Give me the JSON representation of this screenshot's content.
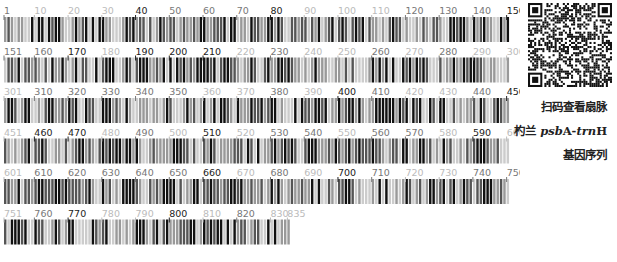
{
  "figure": {
    "type": "dna-barcode",
    "sequence_length": 835,
    "positions_per_row": 150,
    "rows": [
      {
        "start": 1,
        "end": 150,
        "labels": [
          "1",
          "10",
          "20",
          "30",
          "40",
          "50",
          "60",
          "70",
          "80",
          "90",
          "100",
          "110",
          "120",
          "130",
          "140",
          "150"
        ],
        "label_tones": [
          "mid",
          "light",
          "light",
          "light",
          "dark",
          "mid",
          "mid",
          "mid",
          "dark",
          "light",
          "light",
          "light",
          "mid",
          "mid",
          "mid",
          "dark"
        ]
      },
      {
        "start": 151,
        "end": 300,
        "labels": [
          "151",
          "160",
          "170",
          "180",
          "190",
          "200",
          "210",
          "220",
          "230",
          "240",
          "250",
          "260",
          "270",
          "280",
          "290",
          "300"
        ],
        "label_tones": [
          "mid",
          "mid",
          "dark",
          "light",
          "dark",
          "dark",
          "dark",
          "light",
          "mid",
          "light",
          "light",
          "mid",
          "light",
          "mid",
          "light",
          "light"
        ]
      },
      {
        "start": 301,
        "end": 450,
        "labels": [
          "301",
          "310",
          "320",
          "330",
          "340",
          "350",
          "360",
          "370",
          "380",
          "390",
          "400",
          "410",
          "420",
          "430",
          "440",
          "450"
        ],
        "label_tones": [
          "light",
          "mid",
          "mid",
          "mid",
          "mid",
          "mid",
          "light",
          "light",
          "mid",
          "light",
          "dark",
          "mid",
          "light",
          "light",
          "mid",
          "dark"
        ]
      },
      {
        "start": 451,
        "end": 600,
        "labels": [
          "451",
          "460",
          "470",
          "480",
          "490",
          "500",
          "510",
          "520",
          "530",
          "540",
          "550",
          "560",
          "570",
          "580",
          "590",
          "600"
        ],
        "label_tones": [
          "light",
          "dark",
          "dark",
          "light",
          "mid",
          "light",
          "dark",
          "light",
          "mid",
          "mid",
          "light",
          "mid",
          "mid",
          "light",
          "dark",
          "light"
        ]
      },
      {
        "start": 601,
        "end": 750,
        "labels": [
          "601",
          "610",
          "620",
          "630",
          "640",
          "650",
          "660",
          "670",
          "680",
          "690",
          "700",
          "710",
          "720",
          "730",
          "740",
          "750"
        ],
        "label_tones": [
          "light",
          "mid",
          "mid",
          "mid",
          "mid",
          "mid",
          "dark",
          "light",
          "mid",
          "light",
          "dark",
          "mid",
          "light",
          "light",
          "mid",
          "mid"
        ]
      },
      {
        "start": 751,
        "end": 835,
        "labels": [
          "751",
          "760",
          "770",
          "780",
          "790",
          "800",
          "810",
          "820",
          "830",
          "835"
        ],
        "label_tones": [
          "light",
          "mid",
          "dark",
          "light",
          "light",
          "dark",
          "light",
          "mid",
          "light",
          "light"
        ]
      }
    ],
    "base_colors": {
      "A": "#111111",
      "T": "#555555",
      "C": "#999999",
      "G": "#cccccc"
    },
    "label_colors": {
      "dark": "#222222",
      "mid": "#777777",
      "light": "#bbbbbb"
    }
  },
  "qr_code": {
    "icon": "qr-code-icon"
  },
  "caption": {
    "line1": "扫码查看扇脉",
    "line2_prefix": "杓兰 ",
    "line2_gene_italic_1": "psb",
    "line2_gene_plain_1": "A-",
    "line2_gene_italic_2": "trn",
    "line2_gene_plain_2": "H",
    "line3": "基因序列"
  }
}
